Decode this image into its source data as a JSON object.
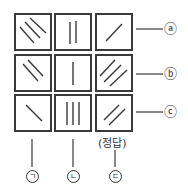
{
  "rows": [
    {
      "label": "ⓐ",
      "key": "a"
    },
    {
      "label": "ⓑ",
      "key": "b"
    },
    {
      "label": "ⓒ",
      "key": "c"
    }
  ],
  "columns": [
    {
      "label": "ㄱ",
      "key": "giyeok"
    },
    {
      "label": "ㄴ",
      "key": "nieun"
    },
    {
      "label": "ㄷ",
      "key": "digeut",
      "note": "(정답)"
    }
  ],
  "cells": [
    [
      {
        "orientation": "diag-down",
        "count": 3
      },
      {
        "orientation": "vertical",
        "count": 2
      },
      {
        "orientation": "diag-up",
        "count": 1
      }
    ],
    [
      {
        "orientation": "diag-down",
        "count": 2
      },
      {
        "orientation": "vertical",
        "count": 1
      },
      {
        "orientation": "diag-up",
        "count": 3
      }
    ],
    [
      {
        "orientation": "diag-down",
        "count": 1
      },
      {
        "orientation": "vertical",
        "count": 3
      },
      {
        "orientation": "diag-up",
        "count": 2
      }
    ]
  ],
  "answer_note": "(정답)",
  "colors": {
    "line": "#3a3a3a",
    "background": "#ffffff"
  }
}
